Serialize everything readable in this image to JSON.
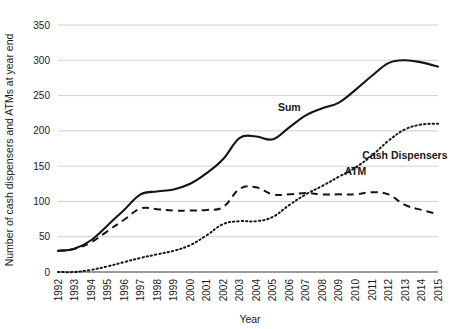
{
  "chart_data": {
    "type": "line",
    "title": "",
    "xlabel": "Year",
    "ylabel": "Number of cash dispensers and ATMs at year end",
    "categories": [
      "1992",
      "1993",
      "1994",
      "1995",
      "1996",
      "1997",
      "1998",
      "1999",
      "2000",
      "2001",
      "2002",
      "2003",
      "2004",
      "2005",
      "2006",
      "2007",
      "2008",
      "2009",
      "2010",
      "2011",
      "2012",
      "2013",
      "2014",
      "2015"
    ],
    "xlim": [
      1992,
      2015
    ],
    "ylim": [
      0,
      350
    ],
    "yticks": [
      0,
      50,
      100,
      150,
      200,
      250,
      300,
      350
    ],
    "grid": true,
    "legend_position": "inline-annotations",
    "series": [
      {
        "name": "Sum",
        "style": "solid",
        "label_x": 2006,
        "label_y": 228,
        "values": [
          30,
          33,
          45,
          66,
          88,
          110,
          114,
          117,
          125,
          140,
          160,
          190,
          192,
          188,
          205,
          222,
          232,
          240,
          258,
          278,
          296,
          300,
          297,
          291
        ]
      },
      {
        "name": "ATM",
        "style": "dotted",
        "label_x": 2010,
        "label_y": 138,
        "values": [
          0,
          0,
          3,
          8,
          14,
          20,
          25,
          30,
          38,
          52,
          68,
          72,
          72,
          78,
          95,
          110,
          122,
          135,
          148,
          165,
          186,
          202,
          209,
          210
        ]
      },
      {
        "name": "Cash Dispensers",
        "style": "dashed",
        "label_x": 2013,
        "label_y": 160,
        "values": [
          30,
          33,
          42,
          58,
          74,
          90,
          89,
          87,
          87,
          88,
          92,
          118,
          120,
          110,
          110,
          112,
          110,
          110,
          110,
          113,
          110,
          95,
          88,
          82
        ]
      }
    ]
  }
}
